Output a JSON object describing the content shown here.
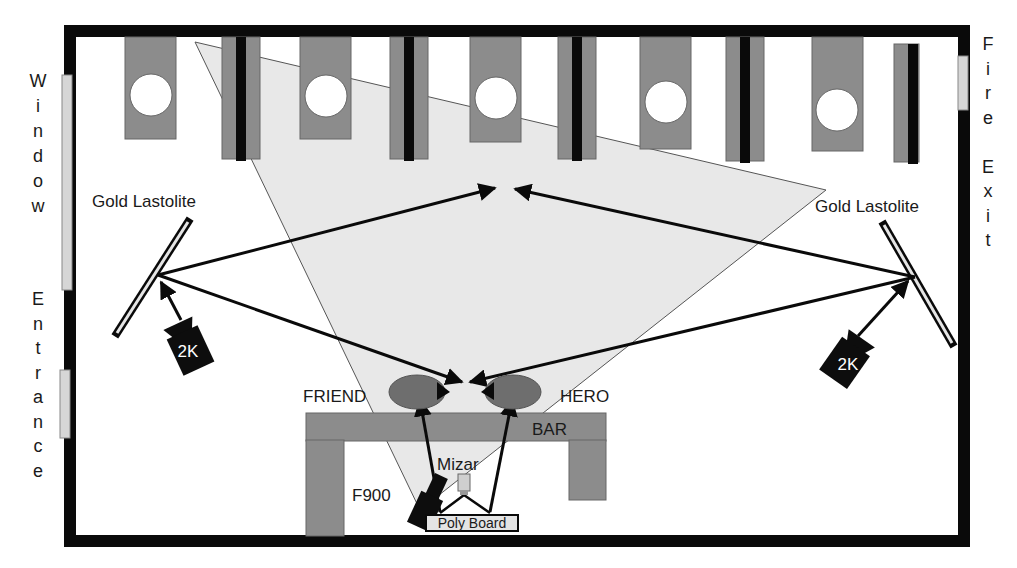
{
  "diagram": {
    "type": "lighting floor plan",
    "colors": {
      "wall": "#0a0a0a",
      "fixture_gray": "#8c8c8c",
      "frustum_fill": "#e8e8e8",
      "window_fill": "#d6d6d6",
      "actor_fill": "#6e6e6e",
      "light_body": "#0d0d0d"
    },
    "labels": {
      "left_wall_top": [
        "W",
        "i",
        "n",
        "d",
        "o",
        "w"
      ],
      "left_wall_bottom": [
        "E",
        "n",
        "t",
        "r",
        "a",
        "n",
        "c",
        "e"
      ],
      "right_wall": [
        "F",
        "i",
        "r",
        "e",
        "",
        "E",
        "x",
        "i",
        "t"
      ],
      "reflector_left": "Gold Lastolite",
      "reflector_right": "Gold Lastolite",
      "light_left": "2K",
      "light_right": "2K",
      "actor_left": "FRIEND",
      "actor_right": "HERO",
      "bar": "BAR",
      "camera": "Mizar",
      "camera_f900": "F900",
      "poly_board": "Poly Board"
    },
    "fixtures": {
      "ceiling_units_with_circle": 5,
      "pillars": 5
    }
  }
}
